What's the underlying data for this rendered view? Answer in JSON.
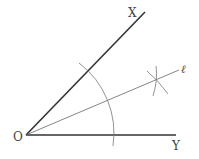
{
  "diagram": {
    "labels": {
      "vertex": "O",
      "ray_x": "X",
      "ray_y": "Y",
      "bisector": "ℓ"
    },
    "colors": {
      "rays": "#333333",
      "bisector": "#666666",
      "arcs": "#777777",
      "text": "#444444"
    }
  }
}
